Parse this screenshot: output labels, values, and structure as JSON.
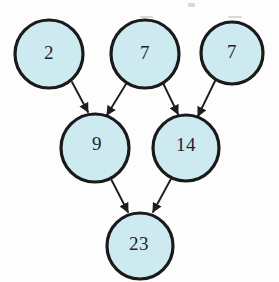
{
  "figure": {
    "type": "node-link-diagram",
    "background_color": "#fdfdfd",
    "node_fill_color": "#cdeaf0",
    "node_stroke_color": "#1a1a1a",
    "label_color": "#1b2430",
    "edge_color": "#1e1e1e"
  },
  "nodes": [
    {
      "id": "n2",
      "label": "2",
      "cx": 49,
      "cy": 54,
      "r": 34,
      "label_dx": 0,
      "label_dy": 1
    },
    {
      "id": "n7a",
      "label": "7",
      "cx": 145,
      "cy": 54,
      "r": 34,
      "label_dx": 0,
      "label_dy": 1
    },
    {
      "id": "n7b",
      "label": "7",
      "cx": 232,
      "cy": 53,
      "r": 31,
      "label_dx": 0,
      "label_dy": 1
    },
    {
      "id": "n9",
      "label": "9",
      "cx": 95,
      "cy": 148,
      "r": 34,
      "label_dx": 2,
      "label_dy": -2
    },
    {
      "id": "n14",
      "label": "14",
      "cx": 186,
      "cy": 148,
      "r": 33,
      "label_dx": 0,
      "label_dy": -1
    },
    {
      "id": "n23",
      "label": "23",
      "cx": 140,
      "cy": 246,
      "r": 33,
      "label_dx": -1,
      "label_dy": 0
    }
  ],
  "edges": [
    {
      "id": "e1",
      "from": "n2",
      "to": "n9",
      "x1": 72,
      "y1": 82,
      "x2": 88,
      "y2": 112
    },
    {
      "id": "e2",
      "from": "n7a",
      "to": "n9",
      "x1": 126,
      "y1": 84,
      "x2": 107,
      "y2": 115
    },
    {
      "id": "e3",
      "from": "n7a",
      "to": "n14",
      "x1": 163,
      "y1": 83,
      "x2": 178,
      "y2": 114
    },
    {
      "id": "e4",
      "from": "n7b",
      "to": "n14",
      "x1": 216,
      "y1": 79,
      "x2": 198,
      "y2": 116
    },
    {
      "id": "e5",
      "from": "n9",
      "to": "n23",
      "x1": 110,
      "y1": 177,
      "x2": 128,
      "y2": 212
    },
    {
      "id": "e6",
      "from": "n14",
      "to": "n23",
      "x1": 172,
      "y1": 177,
      "x2": 153,
      "y2": 212
    }
  ],
  "artifacts": [
    {
      "id": "a1",
      "x": 188,
      "y": 3,
      "w": 7,
      "h": 4
    },
    {
      "id": "a2",
      "x": 140,
      "y": 16,
      "w": 13,
      "h": 2
    },
    {
      "id": "a3",
      "x": 228,
      "y": 16,
      "w": 14,
      "h": 2
    }
  ]
}
